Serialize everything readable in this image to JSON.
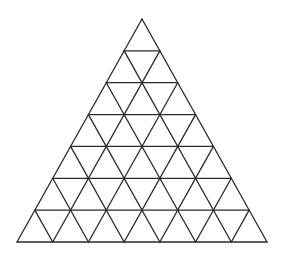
{
  "diagram": {
    "type": "triangular-grid",
    "rows": 7,
    "small_triangles_total": 49,
    "upward_triangles": 28,
    "downward_triangles": 21,
    "apex": [
      142,
      19
    ],
    "base_left": [
      17,
      242
    ],
    "base_right": [
      267,
      242
    ],
    "line_color": "#2a2a2a",
    "background": "#ffffff"
  }
}
